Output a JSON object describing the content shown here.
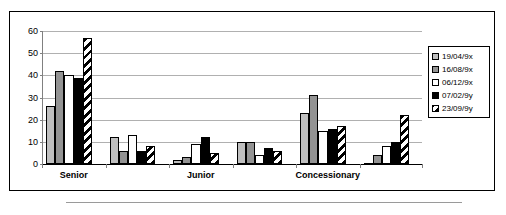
{
  "chart_data": {
    "type": "bar",
    "title": "",
    "subtitle": "",
    "xlabel": "",
    "ylabel": "",
    "ylim": [
      0,
      60
    ],
    "yticks": [
      0,
      10,
      20,
      30,
      40,
      50,
      60
    ],
    "ytick_labels": [
      "0",
      "10",
      "20",
      "30",
      "40",
      "50",
      "60"
    ],
    "grid": true,
    "legend_position": "right",
    "categories": [
      "Senior",
      "",
      "Junior",
      "",
      "Concessionary",
      ""
    ],
    "visible_category_labels": [
      "Senior",
      "Junior",
      "Concessionary"
    ],
    "series": [
      {
        "name": "19/04/9x",
        "values": [
          26,
          12,
          2,
          10,
          23,
          0
        ]
      },
      {
        "name": "16/08/9x",
        "values": [
          42,
          6,
          3,
          10,
          31,
          4
        ]
      },
      {
        "name": "06/12/9x",
        "values": [
          40,
          13,
          9,
          4,
          15,
          8
        ]
      },
      {
        "name": "07/02/9y",
        "values": [
          39,
          6,
          12,
          7,
          16,
          10
        ]
      },
      {
        "name": "23/09/9y",
        "values": [
          57,
          8,
          5,
          6,
          17,
          22
        ]
      }
    ],
    "series_fills": [
      "light-gray",
      "medium-gray",
      "white",
      "black",
      "diagonal-hatch"
    ]
  },
  "legend": {
    "items": [
      {
        "label": "19/04/9x"
      },
      {
        "label": "16/08/9x"
      },
      {
        "label": "06/12/9x"
      },
      {
        "label": "07/02/9y"
      },
      {
        "label": "23/09/9y"
      }
    ]
  },
  "colors": {
    "series_0": "#bfbfbf",
    "series_1": "#939393",
    "series_2": "#ffffff",
    "series_3": "#000000",
    "series_4_hatch": "#000000",
    "gridline": "#b0b0b0",
    "axis": "#808080",
    "border": "#000000",
    "background": "#ffffff"
  }
}
